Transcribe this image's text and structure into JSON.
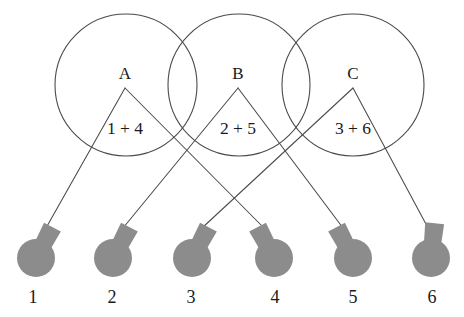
{
  "diagram": {
    "type": "bipartite-grouping-diagram",
    "canvas": {
      "width": 464,
      "height": 317,
      "background": "#ffffff"
    },
    "colors": {
      "stroke": "#4a4a4a",
      "bulb_fill": "#8c8c8c",
      "text": "#1a1a1a",
      "background": "#ffffff"
    },
    "groups": [
      {
        "id": "A",
        "label": "A",
        "sum_label": "1 + 4",
        "circle": {
          "cx": 126,
          "cy": 85,
          "r": 71
        },
        "apex": {
          "x": 125,
          "y": 88
        },
        "label_pos": {
          "x": 125,
          "y": 79
        },
        "sum_pos": {
          "x": 125,
          "y": 134
        },
        "connects": [
          1,
          4
        ]
      },
      {
        "id": "B",
        "label": "B",
        "sum_label": "2 + 5",
        "circle": {
          "cx": 239,
          "cy": 85,
          "r": 71
        },
        "apex": {
          "x": 238,
          "y": 88
        },
        "label_pos": {
          "x": 238,
          "y": 79
        },
        "sum_pos": {
          "x": 238,
          "y": 134
        },
        "connects": [
          2,
          5
        ]
      },
      {
        "id": "C",
        "label": "C",
        "sum_label": "3 + 6",
        "circle": {
          "cx": 353,
          "cy": 85,
          "r": 71
        },
        "apex": {
          "x": 353,
          "y": 88
        },
        "label_pos": {
          "x": 353,
          "y": 79
        },
        "sum_pos": {
          "x": 353,
          "y": 134
        },
        "connects": [
          3,
          6
        ]
      }
    ],
    "bulbs": [
      {
        "number": "1",
        "x": 36,
        "y": 258,
        "label_pos": {
          "x": 33,
          "y": 303
        },
        "neck_dir": "right",
        "wire_to": {
          "x": 46,
          "y": 228
        }
      },
      {
        "number": "2",
        "x": 113,
        "y": 258,
        "label_pos": {
          "x": 112,
          "y": 303
        },
        "neck_dir": "right",
        "wire_to": {
          "x": 123,
          "y": 228
        }
      },
      {
        "number": "3",
        "x": 192,
        "y": 258,
        "label_pos": {
          "x": 191,
          "y": 303
        },
        "neck_dir": "right",
        "wire_to": {
          "x": 202,
          "y": 228
        }
      },
      {
        "number": "4",
        "x": 274,
        "y": 258,
        "label_pos": {
          "x": 275,
          "y": 303
        },
        "neck_dir": "left",
        "wire_to": {
          "x": 264,
          "y": 228
        }
      },
      {
        "number": "5",
        "x": 353,
        "y": 258,
        "label_pos": {
          "x": 353,
          "y": 303
        },
        "neck_dir": "left",
        "wire_to": {
          "x": 343,
          "y": 228
        }
      },
      {
        "number": "6",
        "x": 431,
        "y": 258,
        "label_pos": {
          "x": 432,
          "y": 303
        },
        "neck_dir": "up",
        "wire_to": {
          "x": 427,
          "y": 226
        }
      }
    ],
    "edges": [
      {
        "from_group": "A",
        "to_bulb": "1"
      },
      {
        "from_group": "A",
        "to_bulb": "4"
      },
      {
        "from_group": "B",
        "to_bulb": "2"
      },
      {
        "from_group": "B",
        "to_bulb": "5"
      },
      {
        "from_group": "C",
        "to_bulb": "3"
      },
      {
        "from_group": "C",
        "to_bulb": "6"
      }
    ]
  }
}
